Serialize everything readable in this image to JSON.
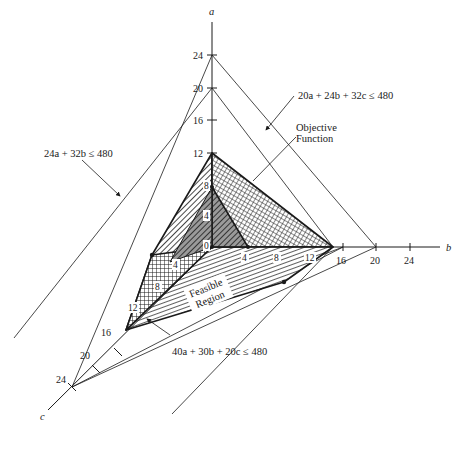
{
  "diagram": {
    "type": "3d-linear-programming-feasible-region",
    "axes": {
      "a": {
        "label": "a",
        "ticks": [
          "4",
          "8",
          "12",
          "16",
          "20",
          "24"
        ]
      },
      "b": {
        "label": "b",
        "ticks": [
          "4",
          "8",
          "12",
          "16",
          "20",
          "24"
        ]
      },
      "c": {
        "label": "c",
        "ticks": [
          "12",
          "16",
          "20",
          "24"
        ]
      },
      "origin_label": "0"
    },
    "inner_labels": {
      "a4": "4",
      "a8": "8",
      "b4": "4",
      "b8": "8",
      "b12": "12",
      "c4": "4",
      "c8": "8",
      "c12": "12"
    },
    "constraints": [
      {
        "id": "c1",
        "text": "24a + 32b ≤ 480"
      },
      {
        "id": "c2",
        "text": "20a + 24b + 32c ≤ 480"
      },
      {
        "id": "c3",
        "text": "40a + 30b + 20c ≤ 480"
      }
    ],
    "annotations": {
      "objective_line1": "Objective",
      "objective_line2": "Function",
      "feasible_line1": "Feasible",
      "feasible_line2": "Region"
    },
    "colors": {
      "ink": "#1a1a1a",
      "background": "#ffffff",
      "shade": "#8c8c8c",
      "label_box": "#ffffff"
    }
  }
}
